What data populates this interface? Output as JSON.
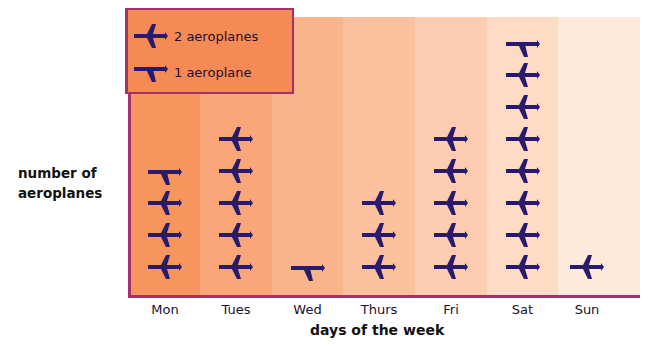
{
  "chart_data": {
    "type": "pictogram",
    "title": "",
    "xlabel": "days of the week",
    "ylabel": "number of aeroplanes",
    "categories": [
      "Mon",
      "Tues",
      "Wed",
      "Thurs",
      "Fri",
      "Sat",
      "Sun"
    ],
    "values": [
      7,
      10,
      1,
      6,
      10,
      15,
      2
    ],
    "symbols": {
      "full": {
        "icon": "aeroplane-icon",
        "value": 2
      },
      "half": {
        "icon": "half-aeroplane-icon",
        "value": 1
      }
    },
    "icon_counts": [
      {
        "full": 3,
        "half": 1
      },
      {
        "full": 5,
        "half": 0
      },
      {
        "full": 0,
        "half": 1
      },
      {
        "full": 3,
        "half": 0
      },
      {
        "full": 5,
        "half": 0
      },
      {
        "full": 7,
        "half": 1
      },
      {
        "full": 1,
        "half": 0
      }
    ],
    "legend": [
      {
        "icon": "aeroplane-icon",
        "label": "2 aeroplanes"
      },
      {
        "icon": "half-aeroplane-icon",
        "label": "1 aeroplane"
      }
    ],
    "legend_position": "top-left"
  },
  "legend": {
    "full_label": "2 aeroplanes",
    "half_label": "1 aeroplane"
  },
  "axes": {
    "ylabel_line1": "number of",
    "ylabel_line2": "aeroplanes",
    "xlabel": "days of the week"
  },
  "colors": {
    "icon": "#2a1a6e",
    "axis": "#a8306a",
    "legend_bg": "#f58a55",
    "columns": [
      "#f7955f",
      "#f9a679",
      "#fab48c",
      "#fbc19f",
      "#fccdb0",
      "#fddbc5",
      "#fdeadc"
    ]
  }
}
